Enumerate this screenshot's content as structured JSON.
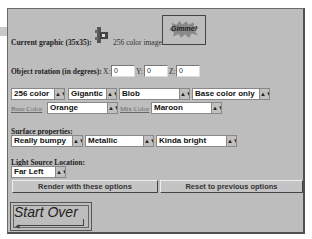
{
  "graphic": {
    "label": "Current graphic (35x35):",
    "icon": "3d-object-thumbnail-icon",
    "image_info": "256 color image",
    "gimme_button": "Gimme!"
  },
  "rotation": {
    "label": "Object rotation (in degrees):",
    "x_label": "X:",
    "x_value": "0",
    "y_label": "Y:",
    "y_value": "0",
    "z_label": "Z:",
    "z_value": "0"
  },
  "options": {
    "color_depth": "256 color",
    "size": "Gigantic",
    "shape": "Blob",
    "color_mode": "Base color only",
    "base_color_label": "Base Color",
    "base_color": "Orange",
    "mix_color_label": "Mix Color",
    "mix_color": "Maroon"
  },
  "surface": {
    "label": "Surface properties:",
    "texture": "Really bumpy",
    "material": "Metallic",
    "brightness": "Kinda bright"
  },
  "light": {
    "label": "Light Source Location:",
    "location": "Far Left"
  },
  "buttons": {
    "render": "Render with these options",
    "reset": "Reset to previous options",
    "start_over": "Start Over"
  },
  "dropdown_arrow": "▲▼"
}
